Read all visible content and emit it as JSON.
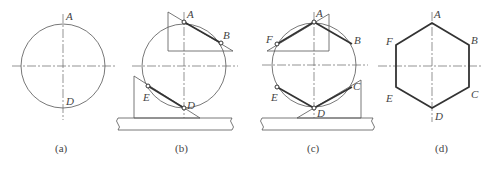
{
  "figure": {
    "panels": [
      {
        "id": "a",
        "caption": "(a)",
        "labels": {
          "A": "A",
          "D": "D"
        },
        "description": "Circle with center lines"
      },
      {
        "id": "b",
        "caption": "(b)",
        "labels": {
          "A": "A",
          "B": "B",
          "D": "D",
          "E": "E"
        },
        "description": "Circle with set squares drawing sides AB and DE on a T-square"
      },
      {
        "id": "c",
        "caption": "(c)",
        "labels": {
          "A": "A",
          "B": "B",
          "C": "C",
          "D": "D",
          "E": "E",
          "F": "F"
        },
        "description": "Circle with set squares drawing sides AF and DC"
      },
      {
        "id": "d",
        "caption": "(d)",
        "labels": {
          "A": "A",
          "B": "B",
          "C": "C",
          "D": "D",
          "E": "E",
          "F": "F"
        },
        "description": "Completed regular hexagon ABCDEF"
      }
    ]
  }
}
